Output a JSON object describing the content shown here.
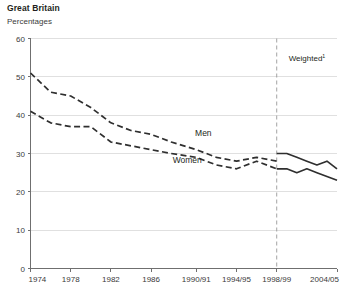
{
  "header": {
    "title": "Great Britain",
    "subtitle": "Percentages"
  },
  "annotation": {
    "weighted_label": "Weighted",
    "weighted_footnote": "1"
  },
  "chart_data": {
    "type": "line",
    "title": "Great Britain",
    "subtitle": "Percentages",
    "xlabel": "",
    "ylabel": "Percentages",
    "ylim": [
      0,
      60
    ],
    "yticks": [
      0,
      10,
      20,
      30,
      40,
      50,
      60
    ],
    "grid": true,
    "legend": "inline",
    "x_tick_labels": [
      "1974",
      "1978",
      "1982",
      "1986",
      "1990/91",
      "1994/95",
      "1998/99",
      "2004/05"
    ],
    "x_tick_values": [
      1974,
      1978,
      1982,
      1986,
      1990.5,
      1994.5,
      1998.5,
      2004.5
    ],
    "xlim": [
      1974,
      2004.5
    ],
    "break_line": {
      "x": 1998.5,
      "label": "Weighted",
      "footnote": "1",
      "style": "dashed-vertical"
    },
    "series": [
      {
        "name": "Men",
        "color": "#2f2f2f",
        "x": [
          1974,
          1976,
          1978,
          1980,
          1982,
          1984,
          1986,
          1988,
          1990.5,
          1992.5,
          1994.5,
          1996.5,
          1998.5
        ],
        "values": [
          51,
          46,
          45,
          42,
          38,
          36,
          35,
          33,
          31,
          29,
          28,
          29,
          28
        ],
        "style": "dashed",
        "weighted_x": [
          1998.5,
          1999.5,
          2000.5,
          2001.5,
          2002.5,
          2003.5,
          2004.5
        ],
        "weighted_values": [
          30,
          30,
          29,
          28,
          27,
          28,
          26
        ],
        "weighted_style": "solid"
      },
      {
        "name": "Women",
        "color": "#2f2f2f",
        "x": [
          1974,
          1976,
          1978,
          1980,
          1982,
          1984,
          1986,
          1988,
          1990.5,
          1992.5,
          1994.5,
          1996.5,
          1998.5
        ],
        "values": [
          41,
          38,
          37,
          37,
          33,
          32,
          31,
          30,
          29,
          27,
          26,
          28,
          26
        ],
        "style": "dashed",
        "weighted_x": [
          1998.5,
          1999.5,
          2000.5,
          2001.5,
          2002.5,
          2003.5,
          2004.5
        ],
        "weighted_values": [
          26,
          26,
          25,
          26,
          25,
          24,
          23
        ],
        "weighted_style": "solid"
      }
    ],
    "series_labels": [
      {
        "name": "Men",
        "x": 1991.2,
        "y": 34.6
      },
      {
        "name": "Women",
        "x": 1989.6,
        "y": 27.4
      }
    ]
  }
}
